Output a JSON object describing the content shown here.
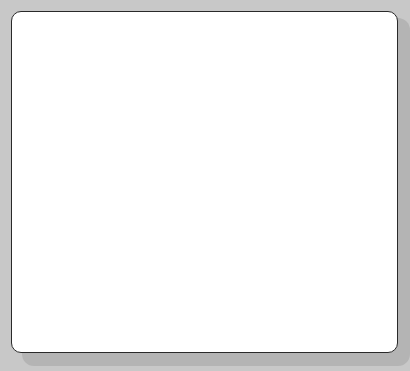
{
  "board": {
    "background": "#ffffff",
    "border_color": "#2a2a2a",
    "grid_color": "#d4d4d4",
    "grid_x": [
      67,
      123,
      178,
      233,
      289,
      344
    ],
    "grid_y": [
      68,
      125,
      182,
      238,
      295
    ]
  },
  "circle": {
    "cx": 200,
    "cy": 190,
    "r": 65,
    "color": "#808080"
  },
  "vertex": {
    "x": 199,
    "y": 191
  },
  "segments": [
    {
      "name": "segment-up",
      "x2": 231,
      "y2": 22
    },
    {
      "name": "segment-down-left",
      "x2": 85,
      "y2": 309
    },
    {
      "name": "segment-down-right",
      "x2": 269,
      "y2": 347
    }
  ],
  "line_color": "#1e1e1e"
}
